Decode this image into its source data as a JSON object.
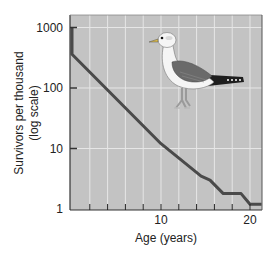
{
  "chart_data": {
    "type": "line",
    "title": "",
    "xlabel": "Age (years)",
    "ylabel": "Survivors per thousand",
    "ylabel_sub": "(log scale)",
    "yscale": "log",
    "xlim": [
      0,
      21.3
    ],
    "ylim": [
      1,
      1000
    ],
    "x_tick_labels": [
      {
        "value": 10,
        "label": "10"
      },
      {
        "value": 20,
        "label": "20"
      }
    ],
    "x_minor_ticks": [
      2,
      4,
      6,
      8,
      10,
      12,
      14,
      16,
      18,
      20
    ],
    "y_tick_labels": [
      {
        "value": 1000,
        "label": "1000"
      },
      {
        "value": 100,
        "label": "100"
      },
      {
        "value": 10,
        "label": "10"
      },
      {
        "value": 1,
        "label": "1"
      }
    ],
    "grid": true,
    "legend": null,
    "series": [
      {
        "name": "Herring gull survivorship",
        "color": "#4a4a4a",
        "x": [
          0,
          0,
          10,
          14.5,
          15.5,
          17,
          19,
          20,
          21.3
        ],
        "y": [
          1000,
          360,
          12,
          3.5,
          3.0,
          1.8,
          1.8,
          1.2,
          1.2
        ]
      }
    ],
    "annotations": [
      {
        "type": "illustration",
        "label": "gull"
      }
    ]
  },
  "colors": {
    "plot_bg": "#c3c3c3",
    "grid": "#e6e6e6",
    "line": "#4a4a4a",
    "axis": "#333333"
  }
}
